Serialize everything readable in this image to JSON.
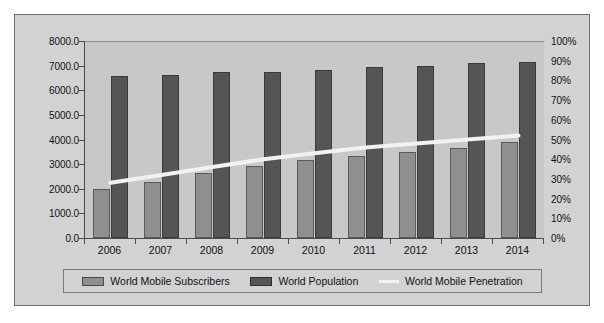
{
  "chart_data": {
    "type": "bar",
    "title": "",
    "subtitle": "",
    "xlabel": "",
    "ylabel": "",
    "y2label": "",
    "categories": [
      "2006",
      "2007",
      "2008",
      "2009",
      "2010",
      "2011",
      "2012",
      "2013",
      "2014"
    ],
    "ylim": [
      0,
      8000
    ],
    "y2lim": [
      0,
      100
    ],
    "grid": false,
    "legend_position": "bottom",
    "y_ticks": [
      "0.0",
      "1000.0",
      "2000.0",
      "3000.0",
      "4000.0",
      "5000.0",
      "6000.0",
      "7000.0",
      "8000.0"
    ],
    "y2_ticks": [
      "0%",
      "10%",
      "20%",
      "30%",
      "40%",
      "50%",
      "60%",
      "70%",
      "80%",
      "90%",
      "100%"
    ],
    "series": [
      {
        "name": "World Mobile Subscribers",
        "chart_type": "bar",
        "axis": "left",
        "color": "#8f8f8f",
        "values": [
          2000,
          2270,
          2640,
          2930,
          3150,
          3320,
          3480,
          3650,
          3880
        ]
      },
      {
        "name": "World Population",
        "chart_type": "bar",
        "axis": "left",
        "color": "#555555",
        "values": [
          6560,
          6630,
          6740,
          6760,
          6830,
          6930,
          6980,
          7090,
          7150
        ]
      },
      {
        "name": "World Mobile Penetration",
        "chart_type": "line",
        "axis": "right",
        "color": "#f2f2f2",
        "values": [
          28,
          32,
          36,
          40,
          43,
          46,
          48,
          50,
          52
        ]
      }
    ]
  },
  "legend": {
    "items": [
      {
        "label": "World Mobile Subscribers",
        "marker": "bar-swatch-light"
      },
      {
        "label": "World Population",
        "marker": "bar-swatch-dark"
      },
      {
        "label": "World Mobile Penetration",
        "marker": "line-swatch-white"
      }
    ]
  },
  "colors": {
    "frame_background": "#d2d2d2",
    "plot_background": "#c8c8c8",
    "axis": "#4a4a4a",
    "subscribers_bar": "#8f8f8f",
    "population_bar": "#555555",
    "penetration_line": "#f2f2f2"
  }
}
